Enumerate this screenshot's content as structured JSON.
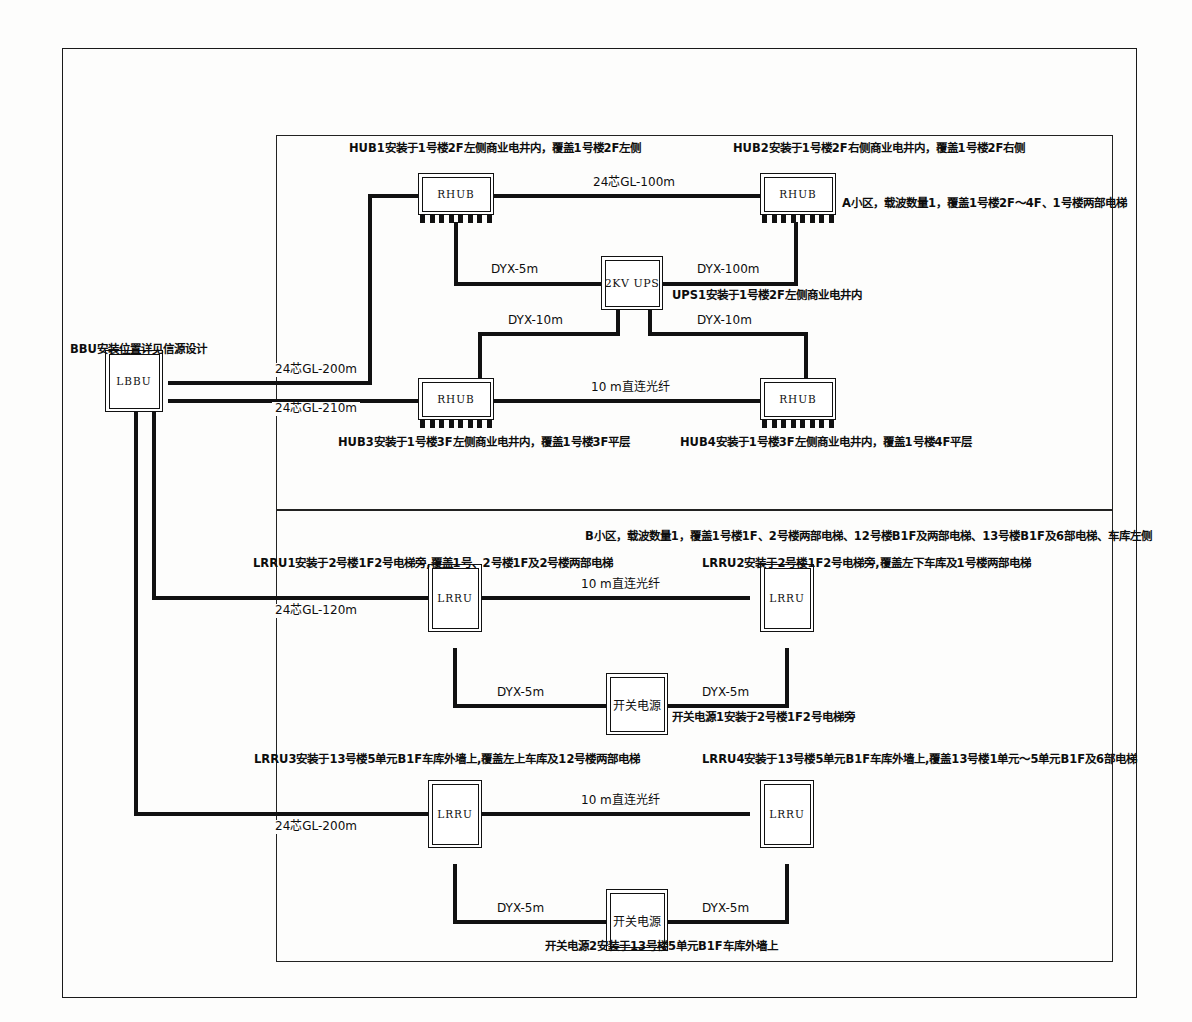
{
  "diagram": {
    "source_node": {
      "id": "LBBU",
      "label": "LBBU",
      "note": "BBU安装位置详见信源设计"
    },
    "areas": [
      {
        "key": "A",
        "note": "A小区，载波数量1，覆盖1号楼2F～4F、1号楼两部电梯"
      },
      {
        "key": "B",
        "note": "B小区，载波数量1，覆盖1号楼1F、2号楼两部电梯、12号楼B1F及两部电梯、13号楼B1F及6部电梯、车库左侧"
      }
    ],
    "devices": [
      {
        "id": "RHUB1",
        "label": "RHUB",
        "note": "HUB1安装于1号楼2F左侧商业电井内，覆盖1号楼2F左侧"
      },
      {
        "id": "RHUB2",
        "label": "RHUB",
        "note": "HUB2安装于1号楼2F右侧商业电井内，覆盖1号楼2F右侧"
      },
      {
        "id": "RHUB3",
        "label": "RHUB",
        "note": "HUB3安装于1号楼3F左侧商业电井内，覆盖1号楼3F平层"
      },
      {
        "id": "RHUB4",
        "label": "RHUB",
        "note": "HUB4安装于1号楼3F左侧商业电井内，覆盖1号楼4F平层"
      },
      {
        "id": "UPS1",
        "label": "2KV  UPS",
        "note": "UPS1安装于1号楼2F左侧商业电井内"
      },
      {
        "id": "LRRU1",
        "label": "LRRU",
        "note": "LRRU1安装于2号楼1F2号电梯旁,覆盖1号、2号楼1F及2号楼两部电梯"
      },
      {
        "id": "LRRU2",
        "label": "LRRU",
        "note": "LRRU2安装于2号楼1F2号电梯旁,覆盖左下车库及1号楼两部电梯"
      },
      {
        "id": "LRRU3",
        "label": "LRRU",
        "note": "LRRU3安装于13号楼5单元B1F车库外墙上,覆盖左上车库及12号楼两部电梯"
      },
      {
        "id": "LRRU4",
        "label": "LRRU",
        "note": "LRRU4安装于13号楼5单元B1F车库外墙上,覆盖13号楼1单元～5单元B1F及6部电梯"
      },
      {
        "id": "PSU1",
        "label": "开关电源",
        "note": "开关电源1安装于2号楼1F2号电梯旁"
      },
      {
        "id": "PSU2",
        "label": "开关电源",
        "note": "开关电源2安装于13号楼5单元B1F车库外墙上"
      }
    ],
    "links": [
      {
        "id": "L1",
        "label": "24芯GL-100m",
        "from": "RHUB1",
        "to": "RHUB2",
        "kind": "fiber"
      },
      {
        "id": "L2",
        "label": "DYX-5m",
        "from": "UPS1",
        "to": "RHUB1",
        "kind": "power"
      },
      {
        "id": "L3",
        "label": "DYX-100m",
        "from": "UPS1",
        "to": "RHUB2",
        "kind": "power"
      },
      {
        "id": "L4",
        "label": "DYX-10m",
        "from": "UPS1",
        "to": "RHUB3",
        "kind": "power"
      },
      {
        "id": "L5",
        "label": "DYX-10m",
        "from": "UPS1",
        "to": "RHUB4",
        "kind": "power"
      },
      {
        "id": "L6",
        "label": "24芯GL-200m",
        "from": "LBBU",
        "to": "RHUB1",
        "kind": "fiber"
      },
      {
        "id": "L7",
        "label": "24芯GL-210m",
        "from": "LBBU",
        "to": "RHUB3",
        "kind": "fiber"
      },
      {
        "id": "L8",
        "label": "10 m直连光纤",
        "from": "RHUB3",
        "to": "RHUB4",
        "kind": "fiber"
      },
      {
        "id": "L9",
        "label": "24芯GL-120m",
        "from": "LBBU",
        "to": "LRRU1",
        "kind": "fiber"
      },
      {
        "id": "L10",
        "label": "10 m直连光纤",
        "from": "LRRU1",
        "to": "LRRU2",
        "kind": "fiber"
      },
      {
        "id": "L11",
        "label": "DYX-5m",
        "from": "PSU1",
        "to": "LRRU1",
        "kind": "power"
      },
      {
        "id": "L12",
        "label": "DYX-5m",
        "from": "PSU1",
        "to": "LRRU2",
        "kind": "power"
      },
      {
        "id": "L13",
        "label": "24芯GL-200m",
        "from": "LBBU",
        "to": "LRRU3",
        "kind": "fiber"
      },
      {
        "id": "L14",
        "label": "10 m直连光纤",
        "from": "LRRU3",
        "to": "LRRU4",
        "kind": "fiber"
      },
      {
        "id": "L15",
        "label": "DYX-5m",
        "from": "PSU2",
        "to": "LRRU3",
        "kind": "power"
      },
      {
        "id": "L16",
        "label": "DYX-5m",
        "from": "PSU2",
        "to": "LRRU4",
        "kind": "power"
      }
    ],
    "colors": {
      "line": "#111111",
      "frame": "#1a1a1a",
      "text": "#0d0d0d",
      "background": "#fdfdfc"
    }
  }
}
